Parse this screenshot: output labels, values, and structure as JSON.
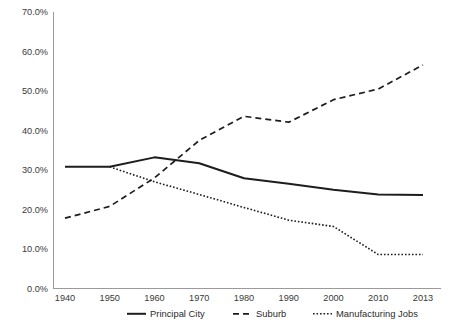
{
  "chart_data": {
    "type": "line",
    "title": "",
    "subtitle": "",
    "xlabel": "",
    "ylabel": "",
    "grid": false,
    "legend_position": "bottom",
    "categories": [
      "1940",
      "1950",
      "1960",
      "1970",
      "1980",
      "1990",
      "2000",
      "2010",
      "2013"
    ],
    "y_tick_labels": [
      "70.0%",
      "60.0%",
      "50.0%",
      "40.0%",
      "30.0%",
      "20.0%",
      "10.0%",
      "0.0%"
    ],
    "y_tick_values": [
      70,
      60,
      50,
      40,
      30,
      20,
      10,
      0
    ],
    "ylim": [
      0,
      70
    ],
    "series": [
      {
        "name": "Principal City",
        "style": "solid",
        "color": "#1d1d1d",
        "values": [
          30.8,
          30.8,
          33.2,
          31.7,
          27.9,
          26.5,
          25.0,
          23.8,
          23.7
        ]
      },
      {
        "name": "Suburb",
        "style": "dashed",
        "color": "#1d1d1d",
        "values": [
          17.8,
          20.8,
          28.0,
          37.5,
          43.6,
          42.1,
          47.8,
          50.5,
          56.6
        ]
      },
      {
        "name": "Manufacturing Jobs",
        "style": "dotted",
        "color": "#1d1d1d",
        "values": [
          null,
          30.8,
          27.0,
          23.8,
          20.5,
          17.3,
          15.7,
          8.6,
          8.6
        ]
      }
    ]
  },
  "legend": {
    "items": [
      {
        "label": "Principal City",
        "style": "solid"
      },
      {
        "label": "Suburb",
        "style": "dashed"
      },
      {
        "label": "Manufacturing Jobs",
        "style": "dotted"
      }
    ]
  }
}
